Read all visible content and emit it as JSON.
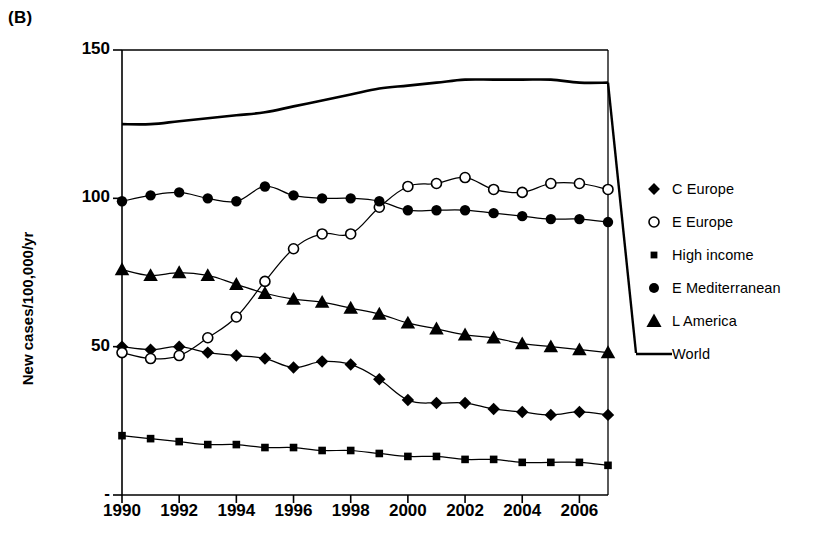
{
  "panel": {
    "label": "(B)"
  },
  "axes": {
    "y_title": "New cases/100,000/yr",
    "y_ticks": [
      {
        "value": 150,
        "label": "150"
      },
      {
        "value": 100,
        "label": "100"
      },
      {
        "value": 50,
        "label": "50"
      },
      {
        "value": 0,
        "label": "-"
      }
    ],
    "x_ticks": [
      {
        "value": 1990,
        "label": "1990"
      },
      {
        "value": 1992,
        "label": "1992"
      },
      {
        "value": 1994,
        "label": "1994"
      },
      {
        "value": 1996,
        "label": "1996"
      },
      {
        "value": 1998,
        "label": "1998"
      },
      {
        "value": 2000,
        "label": "2000"
      },
      {
        "value": 2002,
        "label": "2002"
      },
      {
        "value": 2004,
        "label": "2004"
      },
      {
        "value": 2006,
        "label": "2006"
      }
    ]
  },
  "legend": {
    "items": [
      {
        "label": "C Europe",
        "marker": "diamond-filled-icon"
      },
      {
        "label": "E Europe",
        "marker": "circle-open-icon"
      },
      {
        "label": "High income",
        "marker": "square-filled-icon"
      },
      {
        "label": "E Mediterranean",
        "marker": "circle-filled-icon"
      },
      {
        "label": "L America",
        "marker": "triangle-filled-icon"
      },
      {
        "label": "World",
        "marker": "line-icon"
      }
    ]
  },
  "chart_data": {
    "type": "line",
    "title": "(B)",
    "xlabel": "",
    "ylabel": "New cases/100,000/yr",
    "xlim": [
      1990,
      2007
    ],
    "ylim": [
      0,
      150
    ],
    "grid": false,
    "legend_position": "right",
    "x": [
      1990,
      1991,
      1992,
      1993,
      1994,
      1995,
      1996,
      1997,
      1998,
      1999,
      2000,
      2001,
      2002,
      2003,
      2004,
      2005,
      2006,
      2007
    ],
    "series": [
      {
        "name": "C Europe",
        "marker": "diamond-filled",
        "color": "#000000",
        "values": [
          50,
          49,
          50,
          48,
          47,
          46,
          43,
          45,
          44,
          39,
          32,
          31,
          31,
          29,
          28,
          27,
          28,
          27
        ]
      },
      {
        "name": "E Europe",
        "marker": "circle-open",
        "color": "#000000",
        "values": [
          48,
          46,
          47,
          53,
          60,
          72,
          83,
          88,
          88,
          97,
          104,
          105,
          107,
          103,
          102,
          105,
          105,
          103
        ]
      },
      {
        "name": "High income",
        "marker": "square-filled",
        "color": "#000000",
        "values": [
          20,
          19,
          18,
          17,
          17,
          16,
          16,
          15,
          15,
          14,
          13,
          13,
          12,
          12,
          11,
          11,
          11,
          10
        ]
      },
      {
        "name": "E Mediterranean",
        "marker": "circle-filled",
        "color": "#000000",
        "values": [
          99,
          101,
          102,
          100,
          99,
          104,
          101,
          100,
          100,
          99,
          96,
          96,
          96,
          95,
          94,
          93,
          93,
          92
        ]
      },
      {
        "name": "L America",
        "marker": "triangle-filled",
        "color": "#000000",
        "values": [
          76,
          74,
          75,
          74,
          71,
          68,
          66,
          65,
          63,
          61,
          58,
          56,
          54,
          53,
          51,
          50,
          49,
          48
        ]
      },
      {
        "name": "World",
        "marker": "none",
        "color": "#000000",
        "values": [
          125,
          125,
          126,
          127,
          128,
          129,
          131,
          133,
          135,
          137,
          138,
          139,
          140,
          140,
          140,
          140,
          139,
          139
        ]
      }
    ]
  }
}
